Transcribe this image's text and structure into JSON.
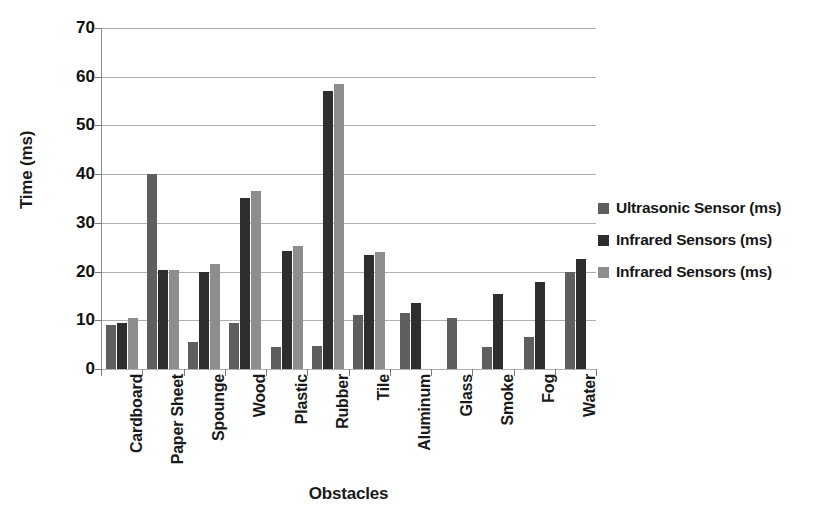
{
  "chart_data": {
    "type": "bar",
    "title": "",
    "xlabel": "Obstacles",
    "ylabel": "Time (ms)",
    "ylim": [
      0,
      70
    ],
    "yticks": [
      0,
      10,
      20,
      30,
      40,
      50,
      60,
      70
    ],
    "grid": true,
    "legend_position": "right",
    "categories": [
      "Cardboard",
      "Paper Sheet",
      "Spounge",
      "Wood",
      "Plastic",
      "Rubber",
      "Tile",
      "Aluminum",
      "Glass",
      "Smoke",
      "Fog",
      "Water"
    ],
    "series": [
      {
        "name": "Ultrasonic Sensor (ms)",
        "color": "#5f5f5f",
        "values": [
          9,
          40,
          5.5,
          9.5,
          4.5,
          4.8,
          11,
          11.5,
          10.5,
          4.5,
          6.5,
          20
        ]
      },
      {
        "name": "Infrared Sensors (ms)",
        "color": "#2e2e2e",
        "values": [
          9.5,
          20.3,
          20,
          35.2,
          24.3,
          57,
          23.5,
          13.5,
          null,
          15.5,
          17.8,
          22.5
        ]
      },
      {
        "name": "Infrared Sensors (ms)",
        "color": "#8e8e8e",
        "values": [
          10.5,
          20.3,
          21.5,
          36.5,
          25.2,
          58.5,
          24,
          null,
          null,
          null,
          null,
          null
        ]
      }
    ]
  },
  "legend": {
    "items": [
      {
        "label": "Ultrasonic Sensor (ms)",
        "color": "#5f5f5f"
      },
      {
        "label": "Infrared Sensors (ms)",
        "color": "#2e2e2e"
      },
      {
        "label": "Infrared Sensors (ms)",
        "color": "#8e8e8e"
      }
    ]
  }
}
